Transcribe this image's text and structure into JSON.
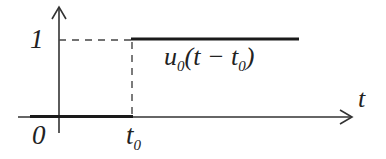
{
  "diagram": {
    "type": "unit step function plot",
    "axes": {
      "x_label": "t",
      "origin_label": "0"
    },
    "y_tick_label": "1",
    "x_tick_label": {
      "base": "t",
      "sub": "0"
    },
    "function_label": {
      "name": "u",
      "name_sub": "0",
      "arg_open": "(t − t",
      "arg_sub": "0",
      "arg_close": ")"
    },
    "colors": {
      "line": "#1a1a1a",
      "axis": "#333333",
      "dashed": "#444444",
      "background": "#ffffff"
    }
  }
}
